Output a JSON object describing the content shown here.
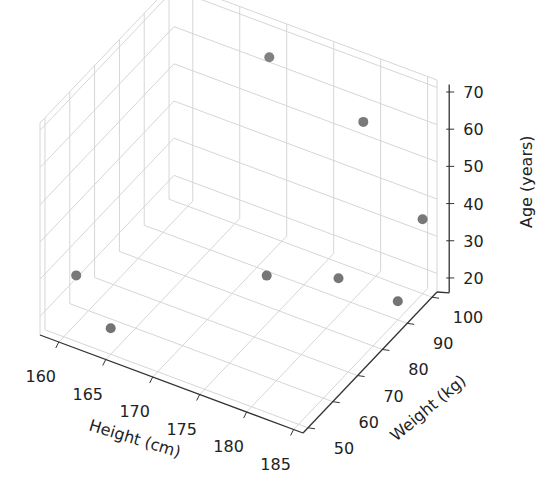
{
  "chart_data": {
    "type": "scatter3d",
    "title": "",
    "xlabel": "Height (cm)",
    "ylabel": "Weight (kg)",
    "zlabel": "Age (years)",
    "x_ticks": [
      160,
      165,
      170,
      175,
      180,
      185
    ],
    "y_ticks": [
      50,
      60,
      70,
      80,
      90,
      100
    ],
    "z_ticks": [
      20,
      30,
      40,
      50,
      60,
      70
    ],
    "xlim": [
      158,
      186
    ],
    "ylim": [
      48,
      102
    ],
    "zlim": [
      15,
      72
    ],
    "grid": true,
    "marker_color": "#7f7f7f",
    "points": [
      {
        "height": 160,
        "weight": 55,
        "age": 28
      },
      {
        "height": 165,
        "weight": 50,
        "age": 22
      },
      {
        "height": 170,
        "weight": 95,
        "age": 68
      },
      {
        "height": 175,
        "weight": 75,
        "age": 28
      },
      {
        "height": 180,
        "weight": 95,
        "age": 60
      },
      {
        "height": 180,
        "weight": 85,
        "age": 25
      },
      {
        "height": 185,
        "weight": 90,
        "age": 20
      },
      {
        "height": 185,
        "weight": 100,
        "age": 35
      }
    ]
  }
}
